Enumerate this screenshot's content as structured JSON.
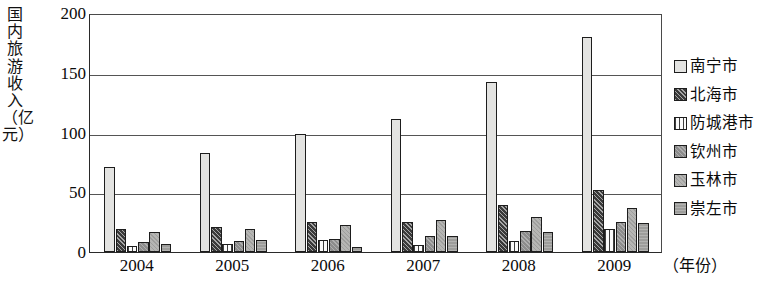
{
  "chart_data": {
    "type": "bar",
    "title": "",
    "ylabel": "国内旅游收入（亿元）",
    "xlabel": "（年份）",
    "categories": [
      "2004",
      "2005",
      "2006",
      "2007",
      "2008",
      "2009"
    ],
    "ylim": [
      0,
      200
    ],
    "yticks": [
      0,
      50,
      100,
      150,
      200
    ],
    "ytick_labels": [
      "0",
      "50",
      "100",
      "150",
      "200"
    ],
    "grid": "horizontal",
    "legend_position": "right",
    "series": [
      {
        "name": "南宁市",
        "values": [
          71,
          83,
          99,
          111,
          142,
          180
        ],
        "color": "#e3e3e1",
        "pattern": "solid-light"
      },
      {
        "name": "北海市",
        "values": [
          19,
          21,
          25,
          25,
          39,
          52
        ],
        "color": "#3a3a3a",
        "pattern": "dark-hatch"
      },
      {
        "name": "防城港市",
        "values": [
          5,
          7,
          10,
          6,
          9,
          19
        ],
        "color": "#fbfbfb",
        "pattern": "vertical-lines"
      },
      {
        "name": "钦州市",
        "values": [
          8,
          9,
          11,
          13,
          18,
          25
        ],
        "color": "#8c8c8c",
        "pattern": "mid-gray-hatch"
      },
      {
        "name": "玉林市",
        "values": [
          17,
          19,
          23,
          27,
          29,
          37
        ],
        "color": "#b6b6b4",
        "pattern": "light-gray-hatch"
      },
      {
        "name": "崇左市",
        "values": [
          7,
          10,
          4,
          13,
          17,
          24
        ],
        "color": "#9d9d9b",
        "pattern": "gray-hatch"
      }
    ]
  },
  "axis": {
    "y_title": "国内旅游收入（亿元）",
    "x_unit": "（年份）"
  }
}
